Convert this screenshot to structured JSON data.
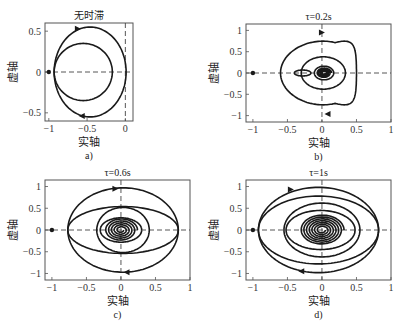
{
  "figure": {
    "width": 404,
    "height": 327,
    "line_color": "#1a1a1a",
    "axis_color": "#555555",
    "dash_color": "#444444"
  },
  "chart_data": [
    {
      "type": "line",
      "id": "a",
      "title": "无时滞",
      "caption": "a)",
      "xlabel": "实轴",
      "ylabel": "虚轴",
      "frame": {
        "left": 45,
        "top": 23,
        "right": 133,
        "bottom": 121
      },
      "xlim": [
        -1.05,
        0.1
      ],
      "ylim": [
        -0.6,
        0.6
      ],
      "xticks": [
        -1,
        -0.5,
        0
      ],
      "xtick_labels": [
        "-1",
        "-0.5",
        "0"
      ],
      "yticks": [
        0.5,
        0,
        -0.5
      ],
      "ytick_labels": [
        "0.5",
        "0",
        "-0.5"
      ],
      "critical_point": [
        -1,
        0
      ],
      "curves": [
        {
          "kind": "ellipse",
          "cx": -0.46,
          "cy": 0,
          "rx": 0.47,
          "ry": 0.55
        },
        {
          "kind": "ellipse",
          "cx": -0.55,
          "cy": 0,
          "rx": 0.38,
          "ry": 0.35
        }
      ],
      "arrows": [
        {
          "x": -0.62,
          "y": 0.53,
          "dir": "right"
        },
        {
          "x": -0.57,
          "y": -0.54,
          "dir": "left"
        }
      ]
    },
    {
      "type": "line",
      "id": "b",
      "title": "τ=0.2s",
      "caption": "b)",
      "xlabel": "实轴",
      "ylabel": "虚轴",
      "frame": {
        "left": 246,
        "top": 24,
        "right": 391,
        "bottom": 122
      },
      "xlim": [
        -1.1,
        1.0
      ],
      "ylim": [
        -1.15,
        1.15
      ],
      "xticks": [
        -1,
        -0.5,
        0,
        0.5,
        1
      ],
      "xtick_labels": [
        "-1",
        "-0.5",
        "0",
        "0.5",
        "1"
      ],
      "yticks": [
        1,
        0.5,
        0,
        -0.5,
        -1
      ],
      "ytick_labels": [
        "1",
        "0.5",
        "0",
        "-0.5",
        "-1"
      ],
      "critical_point": [
        -1,
        0
      ],
      "curves": [
        {
          "kind": "cardioid",
          "cx": 0.02,
          "cy": 0,
          "r": 0.95,
          "xmin": -0.45,
          "xmax": 0.62
        },
        {
          "kind": "ellipse",
          "cx": 0.02,
          "cy": 0,
          "rx": 0.32,
          "ry": 0.38
        },
        {
          "kind": "ellipse",
          "cx": -0.28,
          "cy": 0,
          "rx": 0.12,
          "ry": 0.07
        },
        {
          "kind": "ellipse",
          "cx": 0.03,
          "cy": 0,
          "rx": 0.14,
          "ry": 0.16
        },
        {
          "kind": "spiral",
          "cx": 0.03,
          "cy": 0,
          "r0": 0.11,
          "turns": 4
        }
      ],
      "arrows": [
        {
          "x": 0.0,
          "y": 0.95,
          "dir": "right"
        },
        {
          "x": 0.08,
          "y": -0.96,
          "dir": "left"
        }
      ]
    },
    {
      "type": "line",
      "id": "c",
      "title": "τ=0.6s",
      "caption": "c)",
      "xlabel": "实轴",
      "ylabel": "虚轴",
      "frame": {
        "left": 45,
        "top": 180,
        "right": 190,
        "bottom": 280
      },
      "xlim": [
        -1.1,
        1.0
      ],
      "ylim": [
        -1.15,
        1.15
      ],
      "xticks": [
        -1,
        -0.5,
        0,
        0.5,
        1
      ],
      "xtick_labels": [
        "-1",
        "-0.5",
        "0",
        "0.5",
        "1"
      ],
      "yticks": [
        1,
        0.5,
        0,
        -0.5,
        -1
      ],
      "ytick_labels": [
        "1",
        "0.5",
        "0",
        "-0.5",
        "-1"
      ],
      "critical_point": [
        -1,
        0
      ],
      "curves": [
        {
          "kind": "ellipse",
          "cx": 0.03,
          "cy": 0,
          "rx": 0.8,
          "ry": 0.97
        },
        {
          "kind": "ellipse",
          "cx": 0.03,
          "cy": 0,
          "rx": 0.8,
          "ry": 0.54
        },
        {
          "kind": "ellipse",
          "cx": 0.03,
          "cy": 0,
          "rx": 0.38,
          "ry": 0.52
        },
        {
          "kind": "ellipse",
          "cx": 0.0,
          "cy": 0,
          "rx": 0.3,
          "ry": 0.28
        },
        {
          "kind": "spiral",
          "cx": 0.0,
          "cy": 0,
          "r0": 0.24,
          "turns": 5
        }
      ],
      "arrows": [
        {
          "x": -0.08,
          "y": 0.95,
          "dir": "right"
        },
        {
          "x": 0.08,
          "y": -0.97,
          "dir": "left"
        }
      ]
    },
    {
      "type": "line",
      "id": "d",
      "title": "τ=1s",
      "caption": "d)",
      "xlabel": "实轴",
      "ylabel": "虚轴",
      "frame": {
        "left": 246,
        "top": 180,
        "right": 391,
        "bottom": 280
      },
      "xlim": [
        -1.1,
        1.0
      ],
      "ylim": [
        -1.15,
        1.15
      ],
      "xticks": [
        -1,
        -0.5,
        0,
        0.5,
        1
      ],
      "xtick_labels": [
        "-1",
        "-0.5",
        "0",
        "0.5",
        "1"
      ],
      "yticks": [
        1,
        0.5,
        0,
        -0.5,
        -1
      ],
      "ytick_labels": [
        "1",
        "0.5",
        "0",
        "-0.5",
        "-1"
      ],
      "critical_point": [
        -1,
        0
      ],
      "curves": [
        {
          "kind": "ellipse",
          "cx": -0.05,
          "cy": 0.0,
          "rx": 0.87,
          "ry": 0.98
        },
        {
          "kind": "ellipse",
          "cx": -0.05,
          "cy": 0.0,
          "rx": 0.87,
          "ry": 0.78
        },
        {
          "kind": "ellipse",
          "cx": 0.0,
          "cy": 0.0,
          "rx": 0.55,
          "ry": 0.62
        },
        {
          "kind": "ellipse",
          "cx": -0.02,
          "cy": 0.0,
          "rx": 0.5,
          "ry": 0.45
        },
        {
          "kind": "spiral",
          "cx": 0.0,
          "cy": 0,
          "r0": 0.32,
          "turns": 7
        }
      ],
      "arrows": [
        {
          "x": -0.45,
          "y": 0.93,
          "dir": "right"
        },
        {
          "x": -0.3,
          "y": -0.95,
          "dir": "left"
        }
      ]
    }
  ]
}
